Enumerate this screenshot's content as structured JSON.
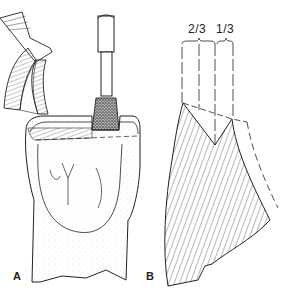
{
  "figure": {
    "panel_a": {
      "label": "A",
      "description": "Tooth crown preparation with stone bur; inset shows cut cross-section"
    },
    "panel_b": {
      "label": "B",
      "description": "Cross-section showing incisal reduction planes",
      "fraction_left": "2/3",
      "fraction_right": "1/3"
    },
    "colors": {
      "ink": "#222222",
      "background": "#ffffff",
      "stipple": "#888888"
    }
  }
}
